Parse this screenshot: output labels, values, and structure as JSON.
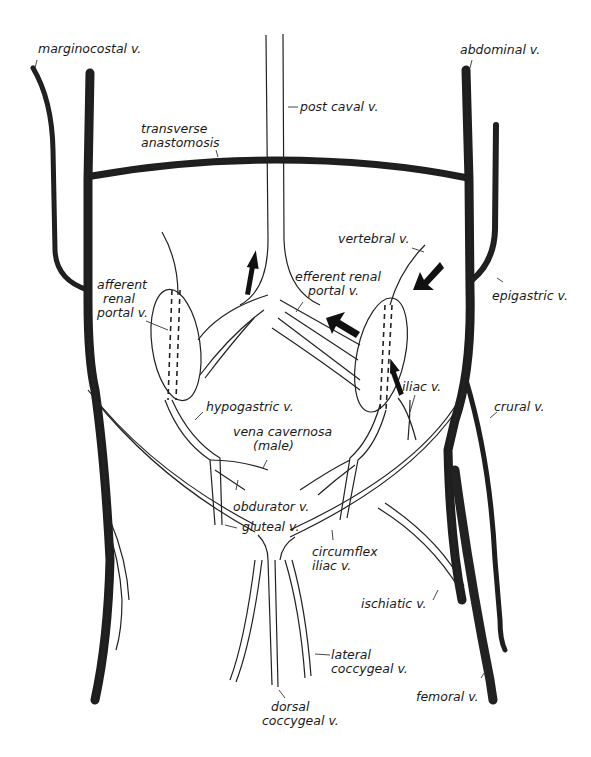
{
  "diagram": {
    "colors": {
      "ink": "#222222",
      "background": "#ffffff"
    },
    "labels": {
      "marginocostal": "marginocostal v.",
      "abdominal": "abdominal v.",
      "post_caval": "post caval v.",
      "transverse_1": "transverse",
      "transverse_2": "anastomosis",
      "vertebral": "vertebral v.",
      "afferent_1": "afferent",
      "afferent_2": "renal",
      "afferent_3": "portal v.",
      "efferent_1": "efferent renal",
      "efferent_2": "portal v.",
      "epigastric": "epigastric v.",
      "hypogastric": "hypogastric v.",
      "iliac": "iliac v.",
      "crural": "crural v.",
      "vena_cavernosa_1": "vena cavernosa",
      "vena_cavernosa_2": "(male)",
      "obdurator": "obdurator v.",
      "gluteal": "gluteal v.",
      "circumflex_1": "circumflex",
      "circumflex_2": "iliac v.",
      "ischiatic": "ischiatic v.",
      "lateral_coccygeal_1": "lateral",
      "lateral_coccygeal_2": "coccygeal v.",
      "dorsal_coccygeal_1": "dorsal",
      "dorsal_coccygeal_2": "coccygeal v.",
      "femoral": "femoral v."
    },
    "arrows": [
      {
        "name": "up-arrow-post-caval",
        "direction": "up"
      },
      {
        "name": "arrow-efferent",
        "direction": "up-left"
      },
      {
        "name": "arrow-vertebral",
        "direction": "down-left"
      },
      {
        "name": "arrow-iliac",
        "direction": "up"
      }
    ]
  }
}
